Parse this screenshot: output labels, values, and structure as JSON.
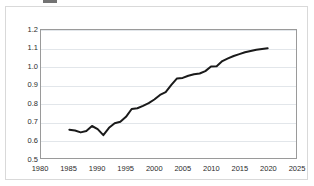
{
  "figure": {
    "name": "line-chart-figure",
    "background_color": "#ffffff",
    "frame_color": "#d9d9d9",
    "plot_border_color": "#9a9a9a",
    "gridline_color": "#e2e6ea",
    "series_color": "#1a1a1a",
    "title_cropped": ""
  },
  "chart_data": {
    "type": "line",
    "title": "",
    "subtitle": "",
    "xlabel": "",
    "ylabel": "",
    "xlim": [
      1980,
      2025
    ],
    "ylim": [
      0.5,
      1.2
    ],
    "xticks": [
      1980,
      1985,
      1990,
      1995,
      2000,
      2005,
      2010,
      2015,
      2020,
      2025
    ],
    "xtick_labels": [
      "1980",
      "1985",
      "1990",
      "1995",
      "2000",
      "2005",
      "2010",
      "2015",
      "2020",
      "2025"
    ],
    "yticks": [
      0.5,
      0.6,
      0.7,
      0.8,
      0.9,
      1.0,
      1.1,
      1.2
    ],
    "ytick_labels": [
      "0.5",
      "0.6",
      "0.7",
      "0.8",
      "0.9",
      "1.0",
      "1.1",
      "1.2"
    ],
    "grid": "horizontal",
    "legend": null,
    "legend_position": "none",
    "annotations": [],
    "series": [
      {
        "name": "series-1",
        "color": "#1a1a1a",
        "line_width": 2,
        "marker": "none",
        "x": [
          1985,
          1986,
          1987,
          1988,
          1989,
          1990,
          1991,
          1992,
          1993,
          1994,
          1995,
          1996,
          1997,
          1998,
          1999,
          2000,
          2001,
          2002,
          2003,
          2004,
          2005,
          2006,
          2007,
          2008,
          2009,
          2010,
          2011,
          2012,
          2013,
          2014,
          2015,
          2016,
          2017,
          2018,
          2019,
          2020
        ],
        "values": [
          0.655,
          0.65,
          0.64,
          0.648,
          0.675,
          0.658,
          0.625,
          0.665,
          0.69,
          0.698,
          0.725,
          0.768,
          0.772,
          0.785,
          0.8,
          0.82,
          0.845,
          0.86,
          0.9,
          0.935,
          0.938,
          0.95,
          0.958,
          0.962,
          0.975,
          1.0,
          1.002,
          1.03,
          1.045,
          1.058,
          1.068,
          1.078,
          1.085,
          1.092,
          1.096,
          1.1
        ]
      }
    ]
  }
}
